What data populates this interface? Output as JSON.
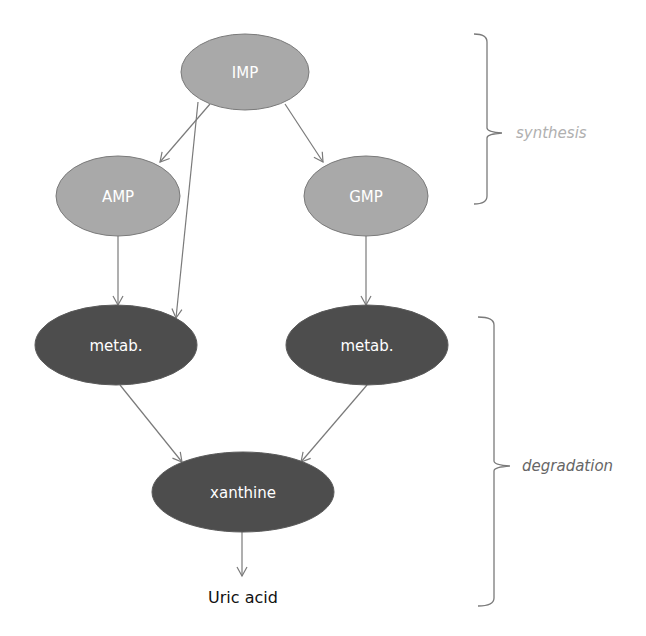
{
  "diagram": {
    "colors": {
      "synthesis_fill": "#a9a9a9",
      "degradation_fill": "#4d4d4d",
      "stroke": "#7a7a7a",
      "edge": "#7a7a7a",
      "synthesis_label": "#b0b0b0",
      "degradation_label": "#666666"
    },
    "nodes": [
      {
        "id": "IMP",
        "label": "IMP",
        "group": "synthesis"
      },
      {
        "id": "AMP",
        "label": "AMP",
        "group": "synthesis"
      },
      {
        "id": "GMP",
        "label": "GMP",
        "group": "synthesis"
      },
      {
        "id": "metab_left",
        "label": "metab.",
        "group": "degradation"
      },
      {
        "id": "metab_right",
        "label": "metab.",
        "group": "degradation"
      },
      {
        "id": "xanthine",
        "label": "xanthine",
        "group": "degradation"
      },
      {
        "id": "uric_acid",
        "label": "Uric acid",
        "group": "product"
      }
    ],
    "edges": [
      {
        "from": "IMP",
        "to": "AMP"
      },
      {
        "from": "IMP",
        "to": "GMP"
      },
      {
        "from": "IMP",
        "to": "metab_left"
      },
      {
        "from": "AMP",
        "to": "metab_left"
      },
      {
        "from": "GMP",
        "to": "metab_right"
      },
      {
        "from": "metab_left",
        "to": "xanthine"
      },
      {
        "from": "metab_right",
        "to": "xanthine"
      },
      {
        "from": "xanthine",
        "to": "uric_acid"
      }
    ],
    "brackets": [
      {
        "label": "synthesis",
        "covers": [
          "IMP",
          "AMP",
          "GMP"
        ]
      },
      {
        "label": "degradation",
        "covers": [
          "metab_left",
          "metab_right",
          "xanthine",
          "uric_acid"
        ]
      }
    ]
  }
}
